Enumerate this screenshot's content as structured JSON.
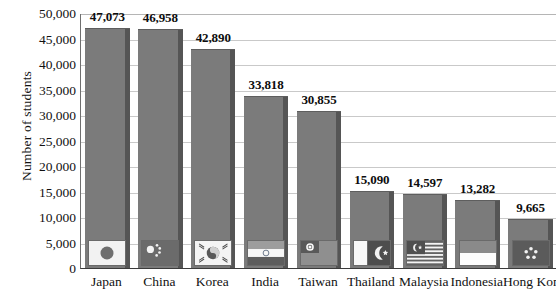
{
  "chart_data": {
    "type": "bar",
    "title": "",
    "xlabel": "",
    "ylabel": "Number of students",
    "categories": [
      "Japan",
      "China",
      "Korea",
      "India",
      "Taiwan",
      "Thailand",
      "Malaysia",
      "Indonesia",
      "Hong Kong"
    ],
    "values": [
      47073,
      46958,
      42890,
      33818,
      30855,
      15090,
      14597,
      13282,
      9665
    ],
    "value_labels": [
      "47,073",
      "46,958",
      "42,890",
      "33,818",
      "30,855",
      "15,090",
      "14,597",
      "13,282",
      "9,665"
    ],
    "ylim": [
      0,
      50000
    ],
    "ytick_values": [
      0,
      5000,
      10000,
      15000,
      20000,
      25000,
      30000,
      35000,
      40000,
      45000,
      50000
    ],
    "ytick_labels": [
      "0",
      "5,000",
      "10,000",
      "15,000",
      "20,000",
      "25,000",
      "30,000",
      "35,000",
      "40,000",
      "45,000",
      "50,000"
    ],
    "grid": true,
    "legend": "none",
    "bar_color": "#7b7b7b",
    "bar_shadow_color": "#555555",
    "gridline_color": "#c9c9c9",
    "axis_color": "#3b3b3b",
    "flags": [
      "japan-flag",
      "china-flag",
      "korea-flag",
      "india-flag",
      "taiwan-flag",
      "thailand-flag",
      "malaysia-flag",
      "indonesia-flag",
      "hong-kong-flag"
    ]
  }
}
